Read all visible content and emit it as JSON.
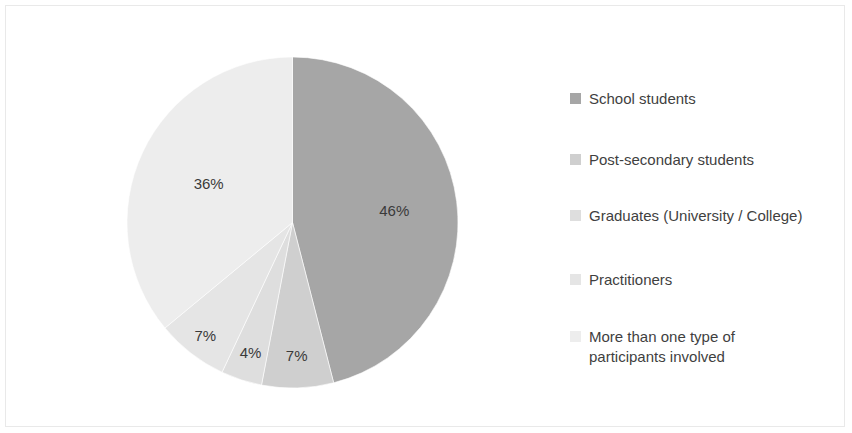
{
  "chart_data": {
    "type": "pie",
    "title": "",
    "subtitle": "",
    "xlabel": "",
    "ylabel": "",
    "grid": false,
    "legend_position": "right",
    "start_angle_deg": 0,
    "direction": "clockwise",
    "categories": [
      "School students",
      "Post-secondary students",
      "Graduates (University / College)",
      "Practitioners",
      "More than one type of\nparticipants involved"
    ],
    "values": [
      46,
      7,
      4,
      7,
      36
    ],
    "data_labels": [
      "46%",
      "7%",
      "4%",
      "7%",
      "36%"
    ],
    "colors": [
      "#a6a6a6",
      "#cfcfcf",
      "#dedede",
      "#e5e5e5",
      "#ededed"
    ],
    "slices": [
      {
        "label": "School students",
        "value": 46,
        "data_label": "46%",
        "color": "#a6a6a6"
      },
      {
        "label": "Post-secondary students",
        "value": 7,
        "data_label": "7%",
        "color": "#cfcfcf"
      },
      {
        "label": "Graduates (University / College)",
        "value": 4,
        "data_label": "4%",
        "color": "#dedede"
      },
      {
        "label": "Practitioners",
        "value": 7,
        "data_label": "7%",
        "color": "#e5e5e5"
      },
      {
        "label": "More than one type of\nparticipants involved",
        "value": 36,
        "data_label": "36%",
        "color": "#ededed"
      }
    ]
  },
  "legend": {
    "items": [
      {
        "label": "School students",
        "color": "#a6a6a6"
      },
      {
        "label": "Post-secondary students",
        "color": "#cfcfcf"
      },
      {
        "label": "Graduates (University / College)",
        "color": "#dedede"
      },
      {
        "label": "Practitioners",
        "color": "#e5e5e5"
      },
      {
        "label": "More than one type of\nparticipants involved",
        "color": "#ededed"
      }
    ]
  },
  "style": {
    "frame_border_color": "#e9e9e9",
    "background": "#ffffff",
    "label_text_color": "#3a3a3a",
    "legend_text_color": "#3f3f3f"
  }
}
